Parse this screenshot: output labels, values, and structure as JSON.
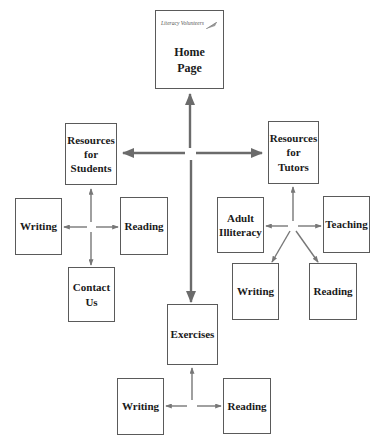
{
  "diagram": {
    "type": "site-map",
    "arrow_color": "#6b6b6b",
    "home": {
      "brand": "Literacy Volunteers",
      "brand_icon": "quill-pen-icon",
      "title": "Home\nPage"
    },
    "students": {
      "title": "Resources\nfor\nStudents",
      "children": [
        {
          "label": "Writing"
        },
        {
          "label": "Reading"
        },
        {
          "label": "Contact\nUs"
        }
      ]
    },
    "tutors": {
      "title": "Resources\nfor\nTutors",
      "children": [
        {
          "label": "Adult\nIlliteracy"
        },
        {
          "label": "Teaching"
        },
        {
          "label": "Writing"
        },
        {
          "label": "Reading"
        }
      ]
    },
    "exercises": {
      "title": "Exercises",
      "children": [
        {
          "label": "Writing"
        },
        {
          "label": "Reading"
        }
      ]
    }
  }
}
